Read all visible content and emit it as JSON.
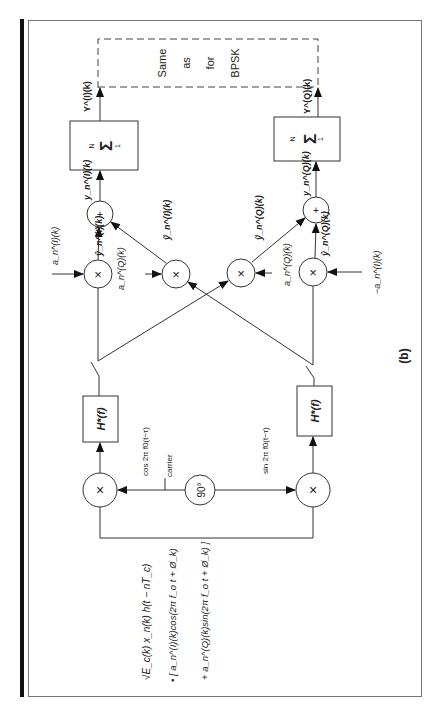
{
  "figure": {
    "label": "(b)",
    "annotation_block": {
      "line1": "Same",
      "line2": "as",
      "line3": "for",
      "line4": "BPSK"
    },
    "input_signal": {
      "line1": "√E_c(k) x_n(k) h(t − nT_c)",
      "line2": "• [ a_n^(I)(k)cos(2π f_o t + Ø_k)",
      "line3": "+ a_n^(Q)(k)sin(2π f_o t + Ø_k) ]"
    },
    "carrier": {
      "label": "carrier",
      "phase_shifter": "90°",
      "cos_label": "cos 2π f0(t−τ)",
      "sin_label": "sin 2π f0(t−τ)"
    },
    "filters": {
      "i_filter": "H*(f)",
      "q_filter": "H*(f)"
    },
    "multipliers": {
      "symbol": "×"
    },
    "adders": {
      "symbol": "+"
    },
    "summers": {
      "symbol": "Σ",
      "upper_limit": "N",
      "lower_limit": "1"
    },
    "signals": {
      "a_n_I": "a_n^(I)(k)",
      "a_n_Q_left": "a_n^(Q)(k)",
      "a_n_Q_right": "a_n^(Q)(k)",
      "neg_a_n_I": "−a_n^(I)(k)",
      "y_hat_I": "ŷ_n^(I)(k)",
      "y_tilde_I": "ỹ_n^(I)(k)",
      "y_tilde_Q": "ỹ_n^(Q)(k)",
      "y_hat_Q": "ŷ_n^(Q)(k)",
      "y_n_I": "y_n^(I)(k)",
      "y_n_Q": "y_n^(Q)(k)",
      "Y_I": "Y^(I)(k)",
      "Y_Q": "Y^(Q)(k)"
    },
    "colors": {
      "stroke": "#333333",
      "background": "#ffffff"
    }
  }
}
